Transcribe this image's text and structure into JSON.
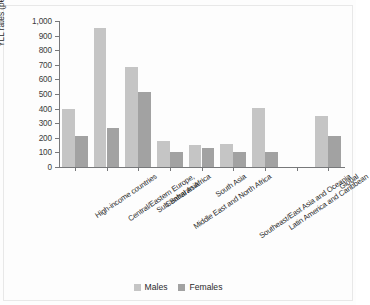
{
  "chart_data": {
    "type": "bar",
    "title": "",
    "xlabel": "",
    "ylabel": "YLL rates (per 100,000)",
    "ylim": [
      0,
      1000
    ],
    "ytick_labels": [
      "1,000",
      "900",
      "800",
      "700",
      "600",
      "500",
      "400",
      "300",
      "200",
      "100",
      "0"
    ],
    "ytick_values": [
      1000,
      900,
      800,
      700,
      600,
      500,
      400,
      300,
      200,
      100,
      0
    ],
    "grid": false,
    "legend_position": "bottom",
    "categories": [
      "High-income countries",
      "Central/Eastern Europe, Central Asia",
      "Sub-Saharan Africa",
      "Middle East and North Africa",
      "South Asia",
      "Southeast/East Asia and Oceania",
      "Latin America and Caribbean",
      "",
      "Global"
    ],
    "category_lines": [
      [
        "High-income countries"
      ],
      [
        "Central/Eastern Europe,",
        "Central Asia"
      ],
      [
        "Sub-Saharan Africa"
      ],
      [
        "Middle East and North Africa"
      ],
      [
        "South Asia"
      ],
      [
        "Southeast/East Asia and Oceania"
      ],
      [
        "Latin America and Caribbean"
      ],
      [
        ""
      ],
      [
        "Global"
      ]
    ],
    "series": [
      {
        "name": "Males",
        "color": "#c5c5c5",
        "values": [
          400,
          950,
          685,
          175,
          150,
          160,
          405,
          null,
          350
        ]
      },
      {
        "name": "Females",
        "color": "#a2a2a2",
        "values": [
          210,
          265,
          515,
          105,
          130,
          100,
          100,
          null,
          215
        ]
      }
    ]
  },
  "legend": {
    "entries": [
      {
        "label": "Males",
        "color": "#c5c5c5"
      },
      {
        "label": "Females",
        "color": "#a2a2a2"
      }
    ]
  },
  "colors": {
    "males": "#c5c5c5",
    "females": "#a2a2a2",
    "axis": "#77787a",
    "text": "#2e2e2e",
    "background": "#fdfdfd"
  }
}
